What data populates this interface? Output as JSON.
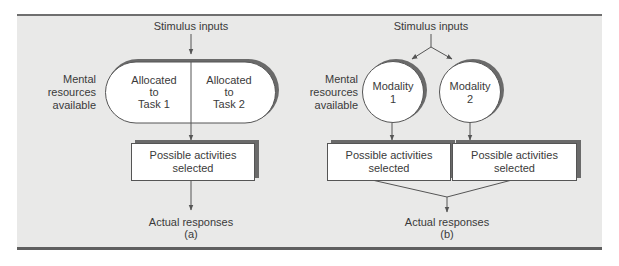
{
  "diagram_a": {
    "stimulus_label": "Stimulus inputs",
    "resources_label": [
      "Mental",
      "resources",
      "available"
    ],
    "pill_left": [
      "Allocated",
      "to",
      "Task 1"
    ],
    "pill_right": [
      "Allocated",
      "to",
      "Task 2"
    ],
    "activities_box": [
      "Possible activities",
      "selected"
    ],
    "responses_label": "Actual responses",
    "panel_letter": "(a)"
  },
  "diagram_b": {
    "stimulus_label": "Stimulus inputs",
    "resources_label": [
      "Mental",
      "resources",
      "available"
    ],
    "modality_1": [
      "Modality",
      "1"
    ],
    "modality_2": [
      "Modality",
      "2"
    ],
    "activities_box_1": [
      "Possible activities",
      "selected"
    ],
    "activities_box_2": [
      "Possible activities",
      "selected"
    ],
    "responses_label": "Actual responses",
    "panel_letter": "(b)"
  },
  "colors": {
    "panel_bg": "#e9e9e8",
    "shadow": "#6a6a6a",
    "line": "#555555",
    "box_fill": "#ffffff"
  }
}
